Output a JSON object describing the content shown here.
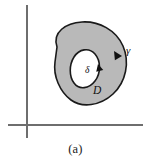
{
  "figure": {
    "caption": "(a)",
    "labels": {
      "outer_curve": "γ",
      "inner_curve": "δ",
      "region": "D"
    },
    "colors": {
      "background": "#ffffff",
      "region_fill": "#b9b9b9",
      "hole_fill": "#ffffff",
      "curve_stroke": "#1a1a1a",
      "axis_stroke": "#6e6e6e",
      "label_color": "#111111"
    },
    "axes": {
      "horizontal": {
        "x1": 8,
        "y1": 125,
        "x2": 143,
        "y2": 125
      },
      "vertical": {
        "x1": 27,
        "y1": 5,
        "x2": 27,
        "y2": 138
      }
    },
    "geometry": {
      "outer_boundary_d": "M 57 47 C 52 32 66 23 82 22 C 99 21 116 30 123 46 C 130 62 126 82 113 94 C 100 106 82 108 71 100 C 60 92 53 76 55 62 Z",
      "inner_boundary_d": "M 74 57 C 79 49 89 47 95 54 C 101 61 101 73 95 81 C 89 89 79 90 74 83 C 69 76 69 65 74 57 Z",
      "outer_arrow": {
        "x": 113,
        "y": 53,
        "rotation_deg": -58
      },
      "inner_arrow": {
        "x": 97,
        "y": 66,
        "rotation_deg": -80
      }
    },
    "label_positions": {
      "gamma": {
        "x": 126,
        "y": 52
      },
      "delta": {
        "x": 87,
        "y": 70
      },
      "region": {
        "x": 97,
        "y": 91
      }
    }
  }
}
